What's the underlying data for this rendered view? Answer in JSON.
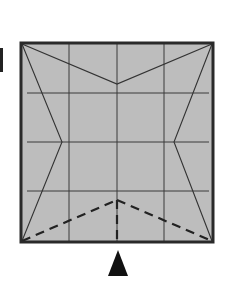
{
  "diagram": {
    "type": "origami-fold-step",
    "paper": {
      "x": 21,
      "y": 43,
      "width": 192,
      "height": 199,
      "fill": "#bdbdbd",
      "border_color": "#2a2a2a",
      "border_width": 3
    },
    "grid": {
      "color": "#3a3a3a",
      "vertical_x": [
        69,
        117,
        164
      ],
      "horizontal_y": [
        93,
        142,
        191
      ]
    },
    "valley_folds_top": {
      "color": "#333333",
      "points": [
        [
          22,
          44
        ],
        [
          117,
          84
        ],
        [
          212,
          44
        ]
      ]
    },
    "side_lines": {
      "color": "#333333",
      "left": [
        [
          22,
          44
        ],
        [
          62,
          142
        ],
        [
          22,
          241
        ]
      ],
      "right": [
        [
          212,
          44
        ],
        [
          174,
          142
        ],
        [
          212,
          241
        ]
      ]
    },
    "dashed_folds": {
      "color": "#222222",
      "dash": "9 6",
      "peak": [
        117,
        200
      ],
      "left_end": [
        22,
        241
      ],
      "right_end": [
        212,
        241
      ],
      "center_vertical": [
        [
          117,
          200
        ],
        [
          117,
          241
        ]
      ]
    },
    "arrow": {
      "shape": "triangle-up",
      "color": "#111111",
      "points": [
        [
          118,
          250
        ],
        [
          108,
          276
        ],
        [
          128,
          276
        ]
      ]
    },
    "edge_mark": {
      "color": "#222222",
      "x": 0,
      "y": 48,
      "width": 3,
      "height": 24
    }
  }
}
